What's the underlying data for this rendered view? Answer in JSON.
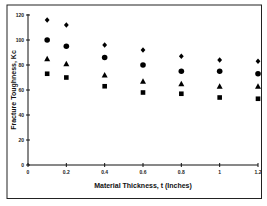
{
  "chart_data": {
    "type": "scatter",
    "title": "",
    "xlabel": "Material Thickness, t (Inches)",
    "ylabel": "Fracture Toughness, Kc",
    "xlim": [
      0,
      1.2
    ],
    "ylim": [
      0,
      120
    ],
    "x_ticks": [
      "0",
      "0.2",
      "0.4",
      "0.6",
      "0.8",
      "1",
      "1.2"
    ],
    "y_ticks": [
      "0",
      "20",
      "40",
      "60",
      "80",
      "100",
      "120"
    ],
    "grid": false,
    "legend": null,
    "x": [
      0.1,
      0.2,
      0.4,
      0.6,
      0.8,
      1.0,
      1.2
    ],
    "series": [
      {
        "name": "diamond",
        "marker": "diamond",
        "values": [
          116,
          112,
          96,
          92,
          87,
          84,
          83
        ]
      },
      {
        "name": "circle",
        "marker": "circle",
        "values": [
          100,
          95,
          86,
          80,
          75,
          75,
          73
        ]
      },
      {
        "name": "triangle",
        "marker": "triangle",
        "values": [
          85,
          81,
          72,
          67,
          65,
          63,
          63
        ]
      },
      {
        "name": "square",
        "marker": "square",
        "values": [
          73,
          70,
          63,
          58,
          57,
          54,
          53
        ]
      }
    ],
    "colors": {
      "marker": "#000000",
      "axis": "#111111",
      "frame": "#222222"
    }
  }
}
